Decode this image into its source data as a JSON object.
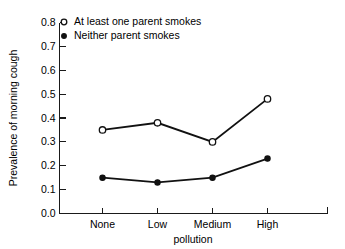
{
  "chart_data": {
    "type": "line",
    "title": "",
    "xlabel": "pollution",
    "ylabel": "Prevalence of morning cough",
    "categories": [
      "None",
      "Low",
      "Medium",
      "High"
    ],
    "series": [
      {
        "name": "At least one parent smokes",
        "marker": "open-circle",
        "values": [
          0.35,
          0.38,
          0.3,
          0.48
        ]
      },
      {
        "name": "Neither parent smokes",
        "marker": "filled-circle",
        "values": [
          0.15,
          0.13,
          0.15,
          0.23
        ]
      }
    ],
    "ylim": [
      0.0,
      0.8
    ],
    "yticks": [
      "0.0",
      "0.1",
      "0.2",
      "0.3",
      "0.4",
      "0.5",
      "0.6",
      "0.7",
      "0.8"
    ],
    "ytick_values": [
      0.0,
      0.1,
      0.2,
      0.3,
      0.4,
      0.5,
      0.6,
      0.7,
      0.8
    ],
    "grid": false,
    "legend_position": "top-left-inside",
    "line_color": "#111111",
    "background_color": "#ffffff"
  }
}
